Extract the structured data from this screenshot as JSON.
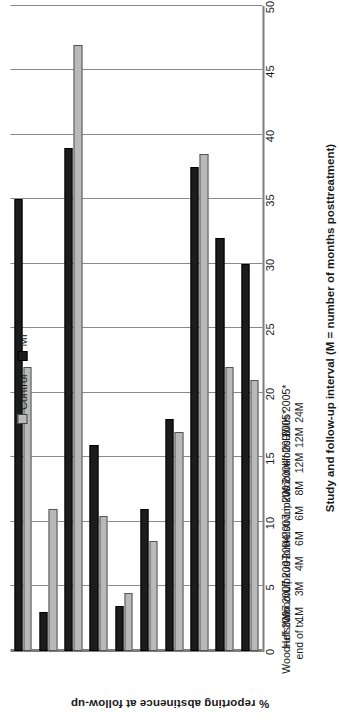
{
  "chart_data": {
    "type": "bar",
    "title": "",
    "xlabel": "Study and follow-up interval (M = number of months posttreatment)",
    "ylabel": "% reporting abstinence at follow-up",
    "ylim": [
      0,
      50
    ],
    "ytick_step": 5,
    "yticks": [
      "0",
      "5",
      "10",
      "15",
      "20",
      "25",
      "30",
      "35",
      "40",
      "45",
      "50"
    ],
    "grid": true,
    "orientation": "horizontal-bars-rotated",
    "legend_position": "top-left",
    "categories": [
      {
        "study": "Woodruff 2007",
        "interval": "end of tx"
      },
      {
        "study": "Helstrom 2007",
        "interval": "1M"
      },
      {
        "study": "Woodruff 2007",
        "interval": "3M"
      },
      {
        "study": "Lipkus 2004",
        "interval": "4M"
      },
      {
        "study": "Horn 2007",
        "interval": "6M"
      },
      {
        "study": "Helstrom 2007",
        "interval": "6M"
      },
      {
        "study": "Lipkus 2004",
        "interval": "8M"
      },
      {
        "study": "Woodruff 2007",
        "interval": "12M"
      },
      {
        "study": "Hollis 2005*",
        "interval": "12M"
      },
      {
        "study": "Hollis 2005*",
        "interval": "24M"
      }
    ],
    "series": [
      {
        "name": "Control",
        "color": "#b9b9b9",
        "values": [
          22.0,
          11.0,
          47.0,
          10.5,
          4.5,
          8.5,
          17.0,
          38.5,
          22.0,
          21.0
        ]
      },
      {
        "name": "MI",
        "color": "#1c1c1c",
        "values": [
          35.0,
          3.0,
          39.0,
          16.0,
          3.5,
          11.0,
          18.0,
          37.5,
          32.0,
          30.0
        ]
      }
    ]
  },
  "legend": {
    "control_label": "Control",
    "mi_label": "MI"
  }
}
